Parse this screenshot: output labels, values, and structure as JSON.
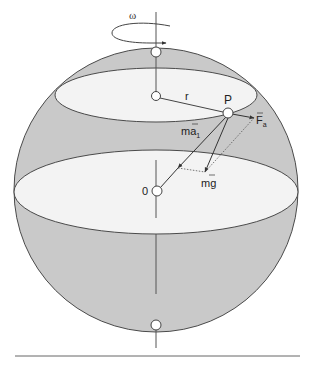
{
  "figure": {
    "type": "physics-diagram",
    "colors": {
      "sphere_fill": "#c9c9c9",
      "ellipse_fill": "#f2f2f2",
      "stroke": "#4a4a4a",
      "background": "#ffffff"
    },
    "labels": {
      "omega": "ω",
      "radius": "r",
      "point": "P",
      "centripetal_force": "ma",
      "centripetal_sub": "1",
      "force_a": "F",
      "force_a_sub": "a",
      "gravity": "mg",
      "origin": "0"
    }
  }
}
